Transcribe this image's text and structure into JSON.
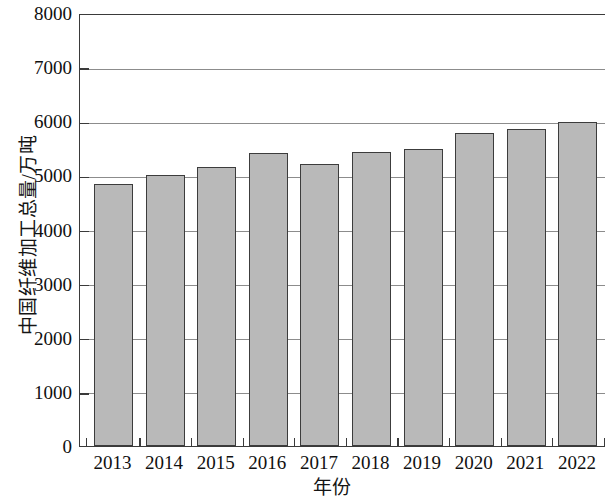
{
  "chart_data": {
    "type": "bar",
    "title": "",
    "xlabel": "年份",
    "ylabel": "中国纤维加工总量/万吨",
    "categories": [
      "2013",
      "2014",
      "2015",
      "2016",
      "2017",
      "2018",
      "2019",
      "2020",
      "2021",
      "2022"
    ],
    "values": [
      4850,
      5000,
      5150,
      5410,
      5210,
      5440,
      5480,
      5780,
      5850,
      5980
    ],
    "ylim": [
      0,
      8000
    ],
    "yticks": [
      0,
      1000,
      2000,
      3000,
      4000,
      5000,
      6000,
      7000,
      8000
    ],
    "ytick_labels": [
      "0",
      "1000",
      "2000",
      "3000",
      "4000",
      "5000",
      "6000",
      "7000",
      "8000"
    ],
    "grid": true,
    "grid_axis": "y",
    "legend": null,
    "bar_fill_color": "#b9b9b9",
    "bar_edge_color": "#3c3c3c",
    "gridline_color": "#8c8c8c",
    "axis_color": "#3a3a3a",
    "note": "Rightmost bar (2022) is clipped by the image edge"
  }
}
